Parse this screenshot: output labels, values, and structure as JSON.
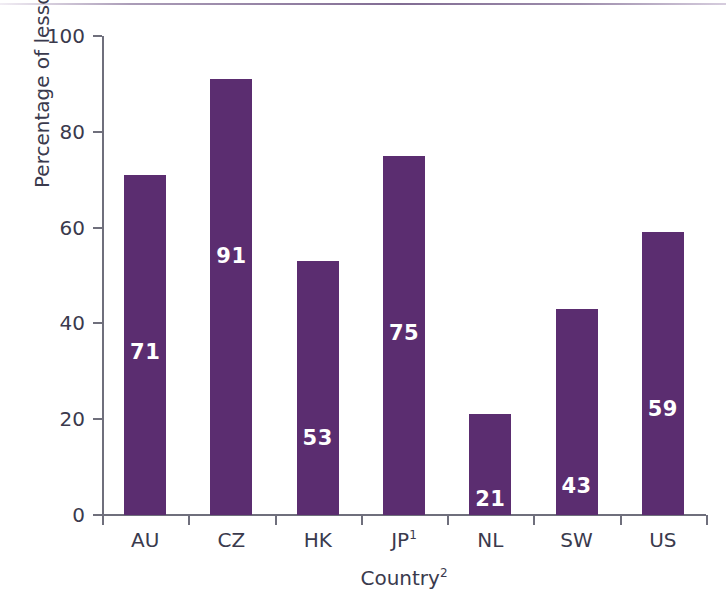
{
  "chart_data": {
    "type": "bar",
    "title": "",
    "subtitle": "",
    "xlabel": "Country",
    "xlabel_superscript": "2",
    "ylabel": "Percentage of lessons",
    "categories": [
      "AU",
      "CZ",
      "HK",
      "JP",
      "NL",
      "SW",
      "US"
    ],
    "category_superscripts": [
      "",
      "",
      "",
      "1",
      "",
      "",
      ""
    ],
    "values": [
      71,
      91,
      53,
      75,
      21,
      43,
      59
    ],
    "value_labels": [
      "71",
      "91",
      "53",
      "75",
      "21",
      "43",
      "59"
    ],
    "ylim": [
      0,
      100
    ],
    "ytick_labels": [
      "0",
      "20",
      "40",
      "60",
      "80",
      "100"
    ],
    "ytick_values": [
      0,
      20,
      40,
      60,
      80,
      100
    ],
    "grid": false,
    "legend": false,
    "legend_position": "none",
    "bar_color": "#5b2d70",
    "value_label_color": "#ffffff",
    "axis_color": "#6f6f7c",
    "text_color": "#3a3a4d",
    "background_color": "#ffffff",
    "accent_rule_color": "#6b5280"
  }
}
